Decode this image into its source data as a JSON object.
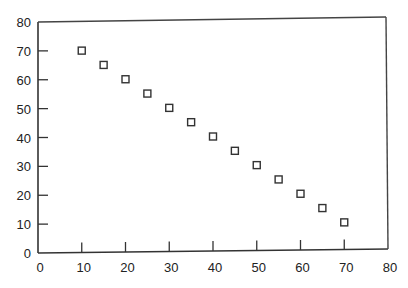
{
  "chart_data": {
    "type": "scatter",
    "title": "",
    "xlabel": "",
    "ylabel": "",
    "xlim": [
      0,
      80
    ],
    "ylim": [
      0,
      80
    ],
    "grid": false,
    "legend": null,
    "marker": "open-square",
    "x_ticks": [
      0,
      10,
      20,
      30,
      40,
      50,
      60,
      70,
      80
    ],
    "y_ticks": [
      0,
      10,
      20,
      30,
      40,
      50,
      60,
      70,
      80
    ],
    "series": [
      {
        "name": "data",
        "x": [
          10,
          15,
          20,
          25,
          30,
          35,
          40,
          45,
          50,
          55,
          60,
          65,
          70
        ],
        "y": [
          70,
          65,
          60,
          55,
          50,
          45,
          40,
          35,
          30,
          25,
          20,
          15,
          10
        ]
      }
    ]
  },
  "colors": {
    "axis": "#333333",
    "marker_stroke": "#333333",
    "background": "#ffffff"
  }
}
